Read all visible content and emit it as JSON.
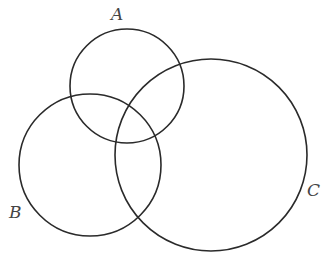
{
  "diagram": {
    "type": "venn",
    "stroke_color": "#2a2a2a",
    "label_color": "#444444",
    "circles": [
      {
        "name": "A",
        "cx": 127,
        "cy": 86,
        "r": 57
      },
      {
        "name": "B",
        "cx": 90,
        "cy": 165,
        "r": 71
      },
      {
        "name": "C",
        "cx": 211,
        "cy": 155,
        "r": 96
      }
    ],
    "labels": [
      {
        "text": "A",
        "x": 111,
        "y": 20
      },
      {
        "text": "B",
        "x": 9,
        "y": 218
      },
      {
        "text": "C",
        "x": 307,
        "y": 196
      }
    ]
  }
}
